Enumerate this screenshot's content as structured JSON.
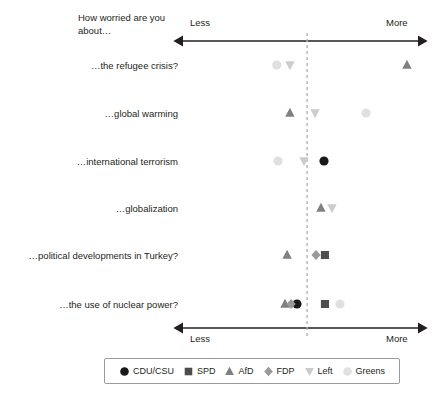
{
  "chart_data": {
    "type": "scatter",
    "title": "How worried are you about…",
    "xlabel": "",
    "ylabel": "",
    "xlim": [
      0,
      100
    ],
    "axis_left_label": "Less",
    "axis_right_label": "More",
    "grid": false,
    "legend_position": "bottom",
    "reference_line": {
      "value": 52.8,
      "style": "dashed"
    },
    "categories": [
      "…the refugee crisis?",
      "…global warming",
      "…international terrorism",
      "…globalization",
      "…political developments in Turkey?",
      "…the use of nuclear power?"
    ],
    "series": [
      {
        "name": "CDU/CSU",
        "marker": "circle",
        "color": "#1a1a1a",
        "values": [
          null,
          null,
          60.0,
          null,
          null,
          48.5
        ]
      },
      {
        "name": "SPD",
        "marker": "square",
        "color": "#4d4d4d",
        "values": [
          null,
          null,
          null,
          null,
          60.4,
          60.4
        ]
      },
      {
        "name": "AfD",
        "marker": "triangle-up",
        "color": "#808080",
        "values": [
          95.3,
          45.5,
          null,
          58.7,
          44.3,
          43.4
        ]
      },
      {
        "name": "FDP",
        "marker": "diamond",
        "color": "#999999",
        "values": [
          null,
          null,
          null,
          null,
          56.6,
          46.0
        ]
      },
      {
        "name": "Left",
        "marker": "triangle-down",
        "color": "#cccccc",
        "values": [
          45.5,
          56.2,
          51.5,
          63.4,
          null,
          null
        ]
      },
      {
        "name": "Greens",
        "marker": "circle-light",
        "color": "#e0e0e0",
        "values": [
          39.9,
          77.9,
          40.4,
          null,
          null,
          66.8
        ]
      }
    ]
  },
  "legend": {
    "items": [
      {
        "label": "CDU/CSU",
        "marker": "circle",
        "color": "#1a1a1a"
      },
      {
        "label": "SPD",
        "marker": "square",
        "color": "#4d4d4d"
      },
      {
        "label": "AfD",
        "marker": "triangle-up",
        "color": "#808080"
      },
      {
        "label": "FDP",
        "marker": "diamond",
        "color": "#999999"
      },
      {
        "label": "Left",
        "marker": "triangle-down",
        "color": "#cccccc"
      },
      {
        "label": "Greens",
        "marker": "circle-light",
        "color": "#e0e0e0"
      }
    ]
  },
  "colors": {
    "axis": "#231f20",
    "reference_line": "#b3b3b3",
    "text": "#231f20",
    "background": "#ffffff"
  }
}
